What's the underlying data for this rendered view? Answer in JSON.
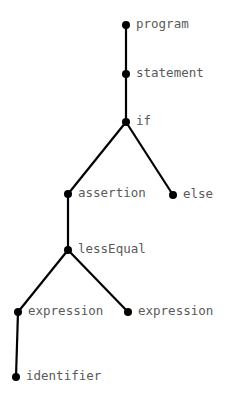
{
  "tree": {
    "edge_color": "#000000",
    "node_color": "#000000",
    "label_color": "#5a5a5a",
    "nodes": [
      {
        "id": "program",
        "label": "program",
        "x": 126,
        "y": 25
      },
      {
        "id": "statement",
        "label": "statement",
        "x": 126,
        "y": 74
      },
      {
        "id": "if",
        "label": "if",
        "x": 126,
        "y": 122
      },
      {
        "id": "assertion",
        "label": "assertion",
        "x": 68,
        "y": 194
      },
      {
        "id": "else",
        "label": "else",
        "x": 173,
        "y": 195
      },
      {
        "id": "lessEqual",
        "label": "lessEqual",
        "x": 68,
        "y": 250
      },
      {
        "id": "expression1",
        "label": "expression",
        "x": 18,
        "y": 312
      },
      {
        "id": "expression2",
        "label": "expression",
        "x": 128,
        "y": 312
      },
      {
        "id": "identifier",
        "label": "identifier",
        "x": 16,
        "y": 377
      }
    ],
    "edges": [
      [
        "program",
        "statement"
      ],
      [
        "statement",
        "if"
      ],
      [
        "if",
        "assertion"
      ],
      [
        "if",
        "else"
      ],
      [
        "assertion",
        "lessEqual"
      ],
      [
        "lessEqual",
        "expression1"
      ],
      [
        "lessEqual",
        "expression2"
      ],
      [
        "expression1",
        "identifier"
      ]
    ]
  }
}
